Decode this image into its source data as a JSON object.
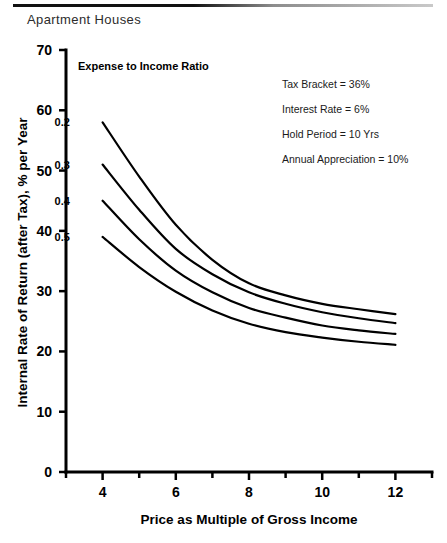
{
  "header": {
    "title": "Apartment Houses"
  },
  "chart_data": {
    "type": "line",
    "title": "Apartment Houses",
    "xlabel": "Price as Multiple of Gross Income",
    "ylabel": "Internal Rate of Return (after Tax), % per Year",
    "xlim": [
      3,
      13
    ],
    "ylim": [
      0,
      70
    ],
    "xticks": [
      4,
      6,
      8,
      10,
      12
    ],
    "xtick_labels": [
      "4",
      "6",
      "8",
      "10",
      "12"
    ],
    "x_minor_ticks": [
      3,
      5,
      7,
      9,
      11,
      13
    ],
    "yticks": [
      0,
      10,
      20,
      30,
      40,
      50,
      60,
      70
    ],
    "ytick_labels": [
      "0",
      "10",
      "20",
      "30",
      "40",
      "50",
      "60",
      "70"
    ],
    "grid": false,
    "legend_position": "in-plot-left",
    "legend_title": "Expense to Income Ratio",
    "x": [
      4,
      5,
      6,
      7,
      8,
      9,
      10,
      11,
      12
    ],
    "series": [
      {
        "name": "0.2",
        "label": "0.2",
        "values": [
          58.0,
          49.0,
          41.0,
          35.2,
          31.3,
          29.3,
          27.9,
          27.0,
          26.2
        ]
      },
      {
        "name": "0.3",
        "label": "0.3",
        "values": [
          51.0,
          43.5,
          37.0,
          32.8,
          29.8,
          27.9,
          26.5,
          25.5,
          24.7
        ]
      },
      {
        "name": "0.4",
        "label": "0.4",
        "values": [
          45.0,
          38.6,
          33.4,
          29.8,
          27.2,
          25.6,
          24.3,
          23.5,
          22.9
        ]
      },
      {
        "name": "0.5",
        "label": "0.5",
        "values": [
          39.0,
          34.0,
          29.9,
          26.8,
          24.6,
          23.2,
          22.3,
          21.6,
          21.1
        ]
      }
    ],
    "annotations": [
      "Tax Bracket = 36%",
      "Interest Rate = 6%",
      "Hold Period = 10 Yrs",
      "Annual Appreciation = 10%"
    ]
  }
}
